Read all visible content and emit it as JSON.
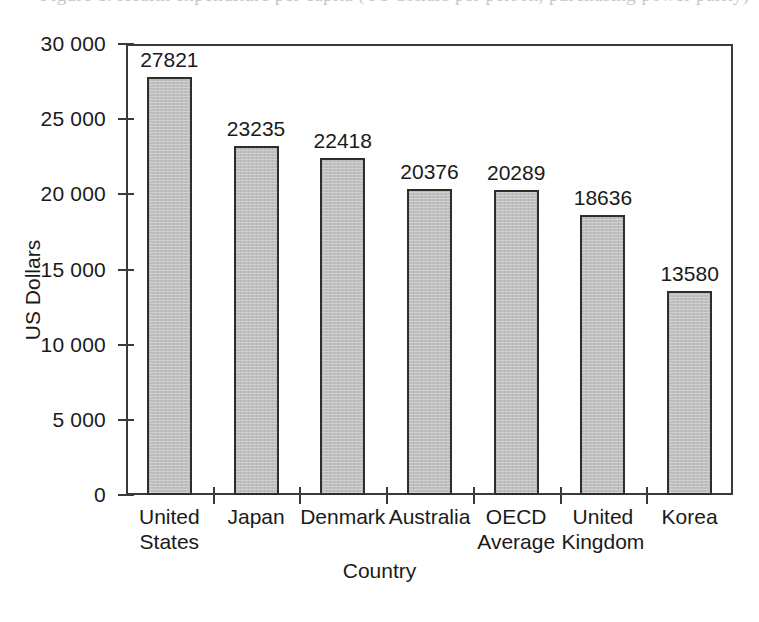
{
  "caption_sliver": {
    "note": "cut-off text line at top edge, illegible",
    "ghost_text": "Figure 1. Health expenditure per capita (US dollars per person, purchasing power parity)"
  },
  "chart_data": {
    "type": "bar",
    "title": "",
    "xlabel": "Country",
    "ylabel": "US Dollars",
    "categories": [
      "United States",
      "Japan",
      "Denmark",
      "Australia",
      "OECD Average",
      "United Kingdom",
      "Korea"
    ],
    "category_lines": [
      [
        "United",
        "States"
      ],
      [
        "Japan",
        ""
      ],
      [
        "Denmark",
        ""
      ],
      [
        "Australia",
        ""
      ],
      [
        "OECD",
        "Average"
      ],
      [
        "United",
        "Kingdom"
      ],
      [
        "Korea",
        ""
      ]
    ],
    "values": [
      27821,
      23235,
      22418,
      20376,
      20289,
      18636,
      13580
    ],
    "value_labels": [
      "27821",
      "23235",
      "22418",
      "20376",
      "20289",
      "18636",
      "13580"
    ],
    "ylim": [
      0,
      30000
    ],
    "ytick_values": [
      0,
      5000,
      10000,
      15000,
      20000,
      25000,
      30000
    ],
    "ytick_labels": [
      "0",
      "5 000",
      "10 000",
      "15 000",
      "20 000",
      "25 000",
      "30 000"
    ],
    "grid": false,
    "legend": false,
    "bar_color": "#bfbfbf",
    "bar_edge_color": "#2e2e2e",
    "axis_color": "#3a3a3a"
  }
}
